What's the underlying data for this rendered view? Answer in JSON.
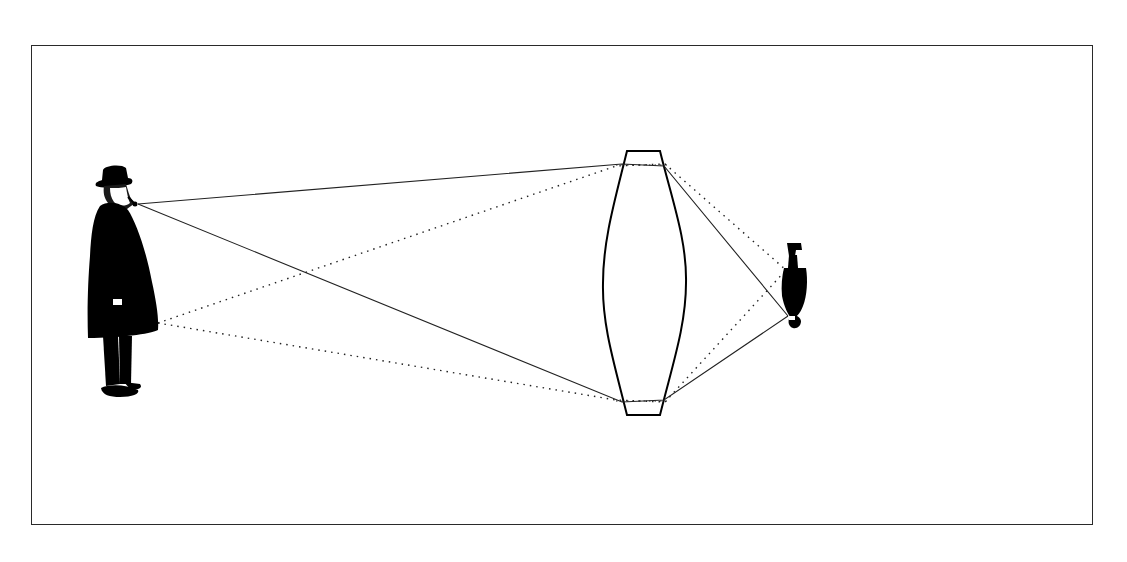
{
  "diagram": {
    "title": "Image formation by a converging lens",
    "description": "A man (object) on the left; rays pass through a biconvex lens and form an inverted, reduced image on the right.",
    "colors": {
      "background": "#ffffff",
      "frame": "#2a2a2a",
      "ink": "#000000",
      "ray": "#222222"
    },
    "frame": {
      "x": 31,
      "y": 45,
      "width": 1062,
      "height": 480
    },
    "object": {
      "label": "object-man",
      "x_range": [
        88,
        160
      ],
      "y_range": [
        165,
        400
      ]
    },
    "lens": {
      "type": "biconvex",
      "top_edge": {
        "x1": 627,
        "x2": 660,
        "y": 151
      },
      "bottom_edge": {
        "x1": 627,
        "x2": 660,
        "y": 415
      },
      "left_bulge_x": 603,
      "right_bulge_x": 686,
      "center_y": 283
    },
    "image": {
      "label": "inverted-image",
      "x_range": [
        780,
        808
      ],
      "y_range": [
        242,
        328
      ]
    },
    "rays": {
      "solid": [
        {
          "from": [
            138,
            204
          ],
          "via": [
            622,
            164
          ],
          "to": [
            788,
            316
          ]
        },
        {
          "from": [
            138,
            204
          ],
          "via": [
            622,
            402
          ],
          "to": [
            788,
            316
          ]
        }
      ],
      "dotted": [
        {
          "from": [
            158,
            323
          ],
          "via": [
            665,
            164
          ],
          "to": [
            786,
            270
          ]
        },
        {
          "from": [
            158,
            323
          ],
          "via": [
            665,
            402
          ],
          "to": [
            786,
            270
          ]
        }
      ],
      "chord_lines": [
        {
          "x1": 616,
          "x2": 668,
          "y": 165,
          "style": "dotted"
        },
        {
          "x1": 616,
          "x2": 668,
          "y": 401,
          "style": "dotted"
        }
      ]
    }
  }
}
